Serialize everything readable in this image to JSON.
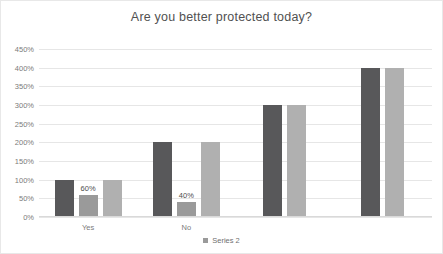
{
  "chart_data": {
    "type": "bar",
    "title": "Are you better protected today?",
    "xlabel": "",
    "ylabel": "",
    "ylim": [
      0,
      450
    ],
    "ytick_labels": [
      "0%",
      "50%",
      "100%",
      "150%",
      "200%",
      "250%",
      "300%",
      "350%",
      "400%",
      "450%"
    ],
    "ytick_values": [
      0,
      50,
      100,
      150,
      200,
      250,
      300,
      350,
      400,
      450
    ],
    "grid": true,
    "legend_position": "bottom",
    "categories": [
      "Yes",
      "No",
      "",
      ""
    ],
    "series": [
      {
        "name": "Series 1",
        "color": "#58585a",
        "values": [
          100,
          200,
          300,
          400
        ]
      },
      {
        "name": "Series 2",
        "color": "#9a9a9a",
        "values": [
          60,
          40,
          null,
          null
        ]
      },
      {
        "name": "Series 3",
        "color": "#b0b0b0",
        "values": [
          100,
          200,
          300,
          400
        ]
      }
    ],
    "data_labels": [
      {
        "group": "Yes",
        "series": "Series 2",
        "text": "60%"
      },
      {
        "group": "No",
        "series": "Series 2",
        "text": "40%"
      }
    ],
    "legend_entries": [
      {
        "label": "Series 2",
        "color": "#9a9a9a"
      }
    ]
  }
}
